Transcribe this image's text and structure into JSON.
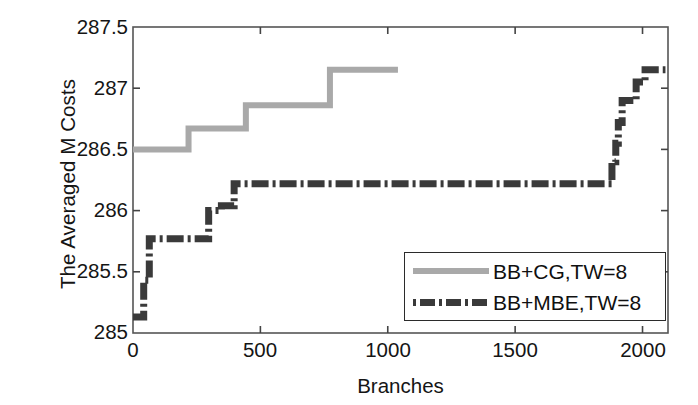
{
  "chart_data": {
    "type": "line",
    "title": "",
    "xlabel": "Branches",
    "ylabel": "The Averaged M Costs",
    "xlim": [
      0,
      2100
    ],
    "ylim": [
      285,
      287.5
    ],
    "xticks": [
      "0",
      "500",
      "1000",
      "1500",
      "2000"
    ],
    "xtick_values": [
      0,
      500,
      1000,
      1500,
      2000
    ],
    "yticks": [
      "285",
      "285.5",
      "286",
      "286.5",
      "287",
      "287.5"
    ],
    "ytick_values": [
      285,
      285.5,
      286,
      286.5,
      287,
      287.5
    ],
    "grid": false,
    "legend_position": "lower right",
    "series": [
      {
        "name": "BB+CG,TW=8",
        "style": "solid",
        "color": "#a9a9a9",
        "step": true,
        "points": [
          [
            0,
            286.5
          ],
          [
            215,
            286.5
          ],
          [
            218,
            286.67
          ],
          [
            440,
            286.67
          ],
          [
            443,
            286.86
          ],
          [
            770,
            286.86
          ],
          [
            773,
            287.15
          ],
          [
            1040,
            287.15
          ]
        ]
      },
      {
        "name": "BB+MBE,TW=8",
        "style": "dash-dot",
        "color": "#3a3a3a",
        "step": true,
        "points": [
          [
            0,
            285.13
          ],
          [
            40,
            285.13
          ],
          [
            42,
            285.43
          ],
          [
            62,
            285.43
          ],
          [
            64,
            285.77
          ],
          [
            115,
            285.77
          ],
          [
            117,
            285.77
          ],
          [
            295,
            285.77
          ],
          [
            297,
            286.0
          ],
          [
            345,
            286.0
          ],
          [
            347,
            286.04
          ],
          [
            395,
            286.04
          ],
          [
            397,
            286.22
          ],
          [
            1860,
            286.22
          ],
          [
            1880,
            286.4
          ],
          [
            1895,
            286.55
          ],
          [
            1905,
            286.72
          ],
          [
            1920,
            286.9
          ],
          [
            1955,
            286.9
          ],
          [
            1975,
            287.05
          ],
          [
            2010,
            287.15
          ],
          [
            2090,
            287.15
          ]
        ]
      }
    ]
  },
  "legend": {
    "entries": [
      {
        "label": "BB+CG,TW=8",
        "sample": "solid-gray-line"
      },
      {
        "label": "BB+MBE,TW=8",
        "sample": "dashdot-dark-line"
      }
    ]
  },
  "axes": {
    "box_color": "#555555",
    "tick_direction": "in"
  }
}
